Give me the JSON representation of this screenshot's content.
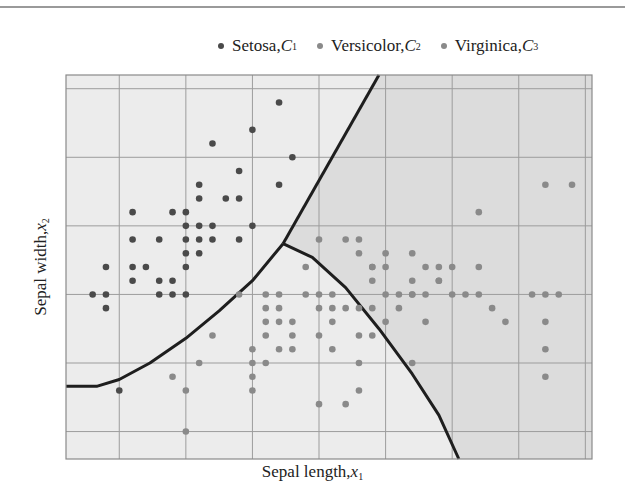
{
  "chart_data": {
    "type": "scatter",
    "title": "",
    "xlabel": "Sepal length, x1",
    "ylabel": "Sepal width, x2",
    "xlim": [
      4.1,
      8.05
    ],
    "ylim": [
      1.8,
      4.6
    ],
    "grid": true,
    "grid_x": [
      4.5,
      5.0,
      5.5,
      6.0,
      6.5,
      7.0,
      7.5,
      8.0
    ],
    "grid_y": [
      2.0,
      2.5,
      3.0,
      3.5,
      4.0,
      4.5
    ],
    "legend_position": "top",
    "legend": [
      {
        "label": "Setosa,",
        "class": "C",
        "sub": "1",
        "color": "#4a4a4a"
      },
      {
        "label": "Versicolor,",
        "class": "C",
        "sub": "2",
        "color": "#8a8a8a"
      },
      {
        "label": "Virginica,",
        "class": "C",
        "sub": "3",
        "color": "#8a8a8a"
      }
    ],
    "regions": {
      "setosa_fill": "#ececec",
      "versicolor_fill": "#ececec",
      "virginica_fill": "#dcdcdc"
    },
    "boundaries": [
      {
        "name": "setosa-virginica",
        "points": [
          [
            5.73,
            3.37
          ],
          [
            6.45,
            4.6
          ]
        ]
      },
      {
        "name": "setosa-versicolor",
        "points": [
          [
            4.1,
            2.33
          ],
          [
            4.33,
            2.33
          ],
          [
            4.5,
            2.38
          ],
          [
            4.73,
            2.5
          ],
          [
            5.0,
            2.68
          ],
          [
            5.25,
            2.88
          ],
          [
            5.5,
            3.1
          ],
          [
            5.73,
            3.37
          ]
        ]
      },
      {
        "name": "versicolor-virginica",
        "points": [
          [
            5.73,
            3.37
          ],
          [
            5.95,
            3.27
          ],
          [
            6.2,
            3.05
          ],
          [
            6.45,
            2.75
          ],
          [
            6.7,
            2.42
          ],
          [
            6.9,
            2.12
          ],
          [
            7.05,
            1.8
          ]
        ]
      }
    ],
    "series": [
      {
        "name": "Setosa",
        "color": "#4a4a4a",
        "points": [
          [
            4.3,
            3.0
          ],
          [
            4.4,
            3.0
          ],
          [
            4.4,
            2.9
          ],
          [
            4.4,
            3.2
          ],
          [
            4.5,
            2.3
          ],
          [
            4.6,
            3.1
          ],
          [
            4.6,
            3.2
          ],
          [
            4.6,
            3.4
          ],
          [
            4.6,
            3.6
          ],
          [
            4.7,
            3.2
          ],
          [
            4.8,
            3.0
          ],
          [
            4.8,
            3.1
          ],
          [
            4.8,
            3.4
          ],
          [
            4.9,
            3.0
          ],
          [
            4.9,
            3.1
          ],
          [
            4.9,
            3.6
          ],
          [
            5.0,
            3.0
          ],
          [
            5.0,
            3.2
          ],
          [
            5.0,
            3.3
          ],
          [
            5.0,
            3.4
          ],
          [
            5.0,
            3.5
          ],
          [
            5.0,
            3.6
          ],
          [
            5.1,
            3.3
          ],
          [
            5.1,
            3.4
          ],
          [
            5.1,
            3.5
          ],
          [
            5.1,
            3.7
          ],
          [
            5.1,
            3.8
          ],
          [
            5.2,
            3.4
          ],
          [
            5.2,
            3.5
          ],
          [
            5.2,
            4.1
          ],
          [
            5.3,
            3.7
          ],
          [
            5.4,
            3.4
          ],
          [
            5.4,
            3.7
          ],
          [
            5.4,
            3.9
          ],
          [
            5.5,
            3.5
          ],
          [
            5.5,
            4.2
          ],
          [
            5.7,
            3.8
          ],
          [
            5.7,
            4.4
          ],
          [
            5.8,
            4.0
          ]
        ]
      },
      {
        "name": "Versicolor",
        "color": "#8a8a8a",
        "points": [
          [
            4.9,
            2.4
          ],
          [
            5.0,
            2.0
          ],
          [
            5.0,
            2.3
          ],
          [
            5.1,
            2.5
          ],
          [
            5.2,
            2.7
          ],
          [
            5.4,
            3.0
          ],
          [
            5.5,
            2.3
          ],
          [
            5.5,
            2.4
          ],
          [
            5.5,
            2.5
          ],
          [
            5.5,
            2.6
          ],
          [
            5.6,
            2.5
          ],
          [
            5.6,
            2.7
          ],
          [
            5.6,
            2.9
          ],
          [
            5.6,
            3.0
          ],
          [
            5.7,
            2.6
          ],
          [
            5.7,
            2.8
          ],
          [
            5.7,
            2.9
          ],
          [
            5.7,
            3.0
          ],
          [
            5.8,
            2.6
          ],
          [
            5.8,
            2.7
          ],
          [
            5.9,
            3.0
          ],
          [
            5.9,
            3.2
          ],
          [
            6.0,
            2.2
          ],
          [
            6.0,
            2.7
          ],
          [
            6.0,
            2.9
          ],
          [
            6.0,
            3.4
          ],
          [
            6.1,
            2.8
          ],
          [
            6.1,
            2.9
          ],
          [
            6.1,
            3.0
          ],
          [
            6.2,
            2.2
          ],
          [
            6.2,
            2.9
          ],
          [
            6.3,
            2.3
          ],
          [
            6.3,
            2.5
          ],
          [
            6.3,
            3.3
          ],
          [
            6.4,
            2.9
          ],
          [
            6.4,
            3.2
          ],
          [
            6.5,
            2.8
          ],
          [
            6.6,
            2.9
          ],
          [
            6.6,
            3.0
          ],
          [
            6.7,
            3.0
          ],
          [
            6.7,
            3.1
          ],
          [
            6.8,
            2.8
          ],
          [
            6.9,
            3.1
          ],
          [
            7.0,
            3.2
          ]
        ]
      },
      {
        "name": "Virginica",
        "color": "#8a8a8a",
        "points": [
          [
            5.6,
            2.8
          ],
          [
            5.8,
            2.8
          ],
          [
            6.0,
            3.0
          ],
          [
            6.1,
            2.6
          ],
          [
            6.3,
            2.7
          ],
          [
            6.3,
            2.9
          ],
          [
            6.3,
            3.4
          ],
          [
            6.4,
            2.7
          ],
          [
            6.4,
            3.1
          ],
          [
            6.4,
            3.2
          ],
          [
            6.5,
            3.0
          ],
          [
            6.5,
            3.2
          ],
          [
            6.7,
            2.5
          ],
          [
            6.7,
            3.0
          ],
          [
            6.7,
            3.3
          ],
          [
            6.8,
            3.0
          ],
          [
            6.8,
            3.2
          ],
          [
            6.9,
            3.1
          ],
          [
            6.9,
            3.2
          ],
          [
            7.1,
            3.0
          ],
          [
            7.2,
            3.0
          ],
          [
            7.2,
            3.2
          ],
          [
            7.2,
            3.6
          ],
          [
            7.3,
            2.9
          ],
          [
            7.4,
            2.8
          ],
          [
            7.6,
            3.0
          ],
          [
            7.7,
            2.6
          ],
          [
            7.7,
            2.8
          ],
          [
            7.7,
            3.0
          ],
          [
            7.7,
            3.8
          ],
          [
            7.9,
            3.8
          ],
          [
            7.7,
            2.4
          ],
          [
            7.8,
            3.0
          ],
          [
            6.2,
            3.4
          ],
          [
            6.5,
            3.3
          ],
          [
            7.0,
            3.0
          ]
        ]
      }
    ]
  },
  "legend": {
    "items": [
      {
        "label": "Setosa,",
        "class_symbol": "C",
        "sub": "1"
      },
      {
        "label": "Versicolor,",
        "class_symbol": "C",
        "sub": "2"
      },
      {
        "label": "Virginica,",
        "class_symbol": "C",
        "sub": "3"
      }
    ]
  },
  "axes": {
    "xlabel_text": "Sepal length,",
    "xlabel_var": "x",
    "xlabel_sub": "1",
    "ylabel_text": "Sepal width,",
    "ylabel_var": "x",
    "ylabel_sub": "2"
  }
}
